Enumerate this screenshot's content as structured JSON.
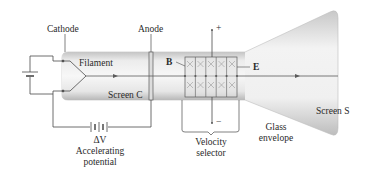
{
  "diagram": {
    "labels": {
      "cathode": "Cathode",
      "anode": "Anode",
      "filament": "Filament",
      "screen_c": "Screen C",
      "b_field": "B⃗",
      "e_field": "E⃗",
      "plus": "+",
      "minus": "−",
      "delta_v": "ΔV",
      "accelerating_1": "Accelerating",
      "accelerating_2": "potential",
      "velocity_1": "Velocity",
      "velocity_2": "selector",
      "glass_1": "Glass",
      "glass_2": "envelope",
      "screen_s": "Screen S"
    },
    "colors": {
      "glass_light": "#f2f2f2",
      "glass_dark": "#b9b9b9",
      "line": "#4a4a4a",
      "text": "#2a2a2a"
    },
    "icons": [
      "battery-icon",
      "field-x-marks-icon",
      "arrow-icon"
    ]
  }
}
